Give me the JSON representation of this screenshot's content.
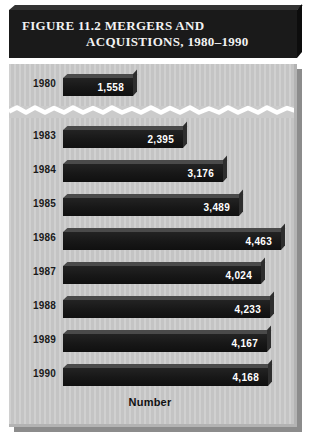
{
  "figure": {
    "title_line1": "FIGURE 11.2  MERGERS AND",
    "title_line2": "ACQUISTIONS, 1980–1990",
    "axis_caption": "Number"
  },
  "colors": {
    "banner_bg": "#1a1a1a",
    "banner_text": "#f2f2f2",
    "panel_bg": "#cbcbcb",
    "bar_fill": "#171717",
    "bar_top": "#4a4a4a",
    "value_text": "#ffffff",
    "year_text": "#1a1a1a",
    "break_line": "#ffffff"
  },
  "chart_data": {
    "type": "bar",
    "orientation": "horizontal",
    "title": "FIGURE 11.2  MERGERS AND ACQUISTIONS, 1980–1990",
    "xlabel": "Number",
    "ylabel": "",
    "categories": [
      "1980",
      "1983",
      "1984",
      "1985",
      "1986",
      "1987",
      "1988",
      "1989",
      "1990"
    ],
    "values": [
      1558,
      2395,
      3176,
      3489,
      4463,
      4024,
      4233,
      4167,
      4168
    ],
    "value_labels": [
      "1,558",
      "2,395",
      "3,176",
      "3,489",
      "4,463",
      "4,024",
      "4,233",
      "4,167",
      "4,168"
    ],
    "bar_pixel_widths": [
      70,
      120,
      160,
      176,
      218,
      198,
      207,
      204,
      205
    ],
    "grid": false,
    "legend": null,
    "axis_break": {
      "present": true,
      "between": [
        "1980",
        "1983"
      ],
      "style": "torn-wavy-white-line",
      "note": "Years 1981 and 1982 are omitted; a jagged break separates 1980 from 1983."
    },
    "xlim": [
      0,
      4600
    ]
  }
}
